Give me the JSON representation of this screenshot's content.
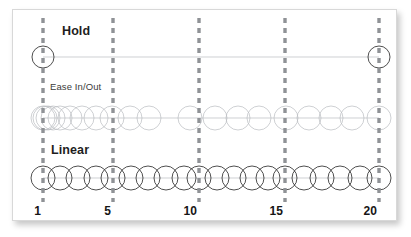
{
  "figure": {
    "background": "#ffffff",
    "card_background": "#ffffff",
    "card_border_color": "#d8d8d8",
    "dash_color": "#8f9296",
    "circle_color_dark": "#2f2f2f",
    "circle_color_light": "#b9bcc0",
    "baseline_color": "#b9bcc0"
  },
  "rows": [
    {
      "id": "hold",
      "label": "Hold",
      "label_x": 62,
      "label_y": 32,
      "axis_y": 57,
      "style": "dark"
    },
    {
      "id": "ease",
      "label": "Ease In/Out",
      "label_x": 50,
      "label_y": 88,
      "axis_y": 118,
      "style": "light"
    },
    {
      "id": "linear",
      "label": "Linear",
      "label_x": 51,
      "label_y": 151,
      "axis_y": 178,
      "style": "dark"
    }
  ],
  "axis": {
    "frame_min": 1,
    "frame_max": 20,
    "x_min": 43,
    "x_max": 379,
    "labels_y": 212,
    "ticks": [
      {
        "frame": 1,
        "label": "1",
        "x": 43
      },
      {
        "frame": 5,
        "label": "5",
        "x": 113
      },
      {
        "frame": 10,
        "label": "10",
        "x": 199
      },
      {
        "frame": 15,
        "label": "15",
        "x": 285
      },
      {
        "frame": 20,
        "label": "20",
        "x": 379
      }
    ],
    "dash_top": 18,
    "dash_bottom": 202
  },
  "chart_data": {
    "type": "scatter",
    "xlabel": "",
    "ylabel": "",
    "xlim": [
      1,
      20
    ],
    "grid": false,
    "legend": "none",
    "x_tick_labels": [
      "1",
      "5",
      "10",
      "15",
      "20"
    ],
    "x_tick_values": [
      1,
      5,
      10,
      15,
      20
    ],
    "series": [
      {
        "name": "Hold",
        "marker": "circle",
        "radius": 11,
        "stroke": "#2f2f2f",
        "axis_y": 57,
        "positions_frames": [
          1,
          20
        ],
        "positions_px": [
          43,
          379
        ]
      },
      {
        "name": "Ease In/Out",
        "marker": "circle",
        "radius": 12,
        "stroke": "#b9bcc0",
        "axis_y": 118,
        "positions_frames": [
          1,
          2,
          3,
          4,
          5,
          6,
          7,
          8,
          9,
          10,
          11,
          12,
          13,
          14,
          15,
          16,
          17,
          18,
          19,
          20
        ],
        "positions_px": [
          43,
          45,
          48,
          53,
          60,
          70,
          82,
          96,
          112,
          130,
          149,
          190,
          215,
          238,
          259,
          286,
          309,
          331,
          352,
          379
        ]
      },
      {
        "name": "Linear",
        "marker": "circle",
        "radius": 12,
        "stroke": "#2f2f2f",
        "axis_y": 178,
        "positions_frames": [
          1,
          2,
          3,
          4,
          5,
          6,
          7,
          8,
          9,
          10,
          11,
          12,
          13,
          14,
          15,
          16,
          17,
          18,
          19,
          20
        ],
        "positions_px": [
          43,
          60,
          78,
          96,
          113,
          131,
          148,
          166,
          184,
          199,
          217,
          234,
          252,
          268,
          285,
          304,
          322,
          340,
          360,
          379
        ]
      }
    ],
    "annotations": [
      {
        "text": "Hold",
        "x": 62,
        "y": 32
      },
      {
        "text": "Ease In/Out",
        "x": 50,
        "y": 88
      },
      {
        "text": "Linear",
        "x": 51,
        "y": 151
      }
    ]
  }
}
